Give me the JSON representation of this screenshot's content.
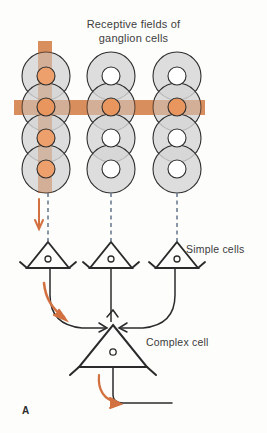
{
  "figure": {
    "panel_letter": "A",
    "title": {
      "line1": "Receptive fields of",
      "line2": "ganglion cells"
    },
    "labels": {
      "simple_cells": "Simple cells",
      "complex_cell": "Complex cell"
    },
    "colors": {
      "stimulus_bar": "#e2986a",
      "stimulus_bar_dark": "#c77a4e",
      "receptive_field_fill": "#d6d6d6",
      "receptive_field_stroke": "#2f2f2f",
      "center_orange": "#eda06c",
      "center_white": "#ffffff",
      "arrow_orange": "#d2713f",
      "neuron_stroke": "#2b2b2b",
      "dashed_line": "#6b7d92",
      "background": "#fdfdfc"
    },
    "stimulus": {
      "vertical_bar": {
        "x": 38,
        "y": 41,
        "width": 14,
        "height": 152
      },
      "horizontal_bar": {
        "x": 14,
        "y": 100,
        "width": 191,
        "height": 15
      }
    },
    "receptive_field_columns": [
      {
        "name": "column-1",
        "cx": 46,
        "centers_y": [
          76,
          107,
          138,
          169
        ],
        "outer_radius": 24,
        "inner_radius": 9,
        "center_fills": [
          "orange",
          "orange",
          "orange",
          "orange"
        ]
      },
      {
        "name": "column-2",
        "cx": 111,
        "centers_y": [
          76,
          107,
          138,
          169
        ],
        "outer_radius": 24,
        "inner_radius": 9,
        "center_fills": [
          "white",
          "orange",
          "white",
          "white"
        ]
      },
      {
        "name": "column-3",
        "cx": 177,
        "centers_y": [
          76,
          107,
          138,
          169
        ],
        "outer_radius": 24,
        "inner_radius": 9,
        "center_fills": [
          "white",
          "orange",
          "white",
          "white"
        ]
      }
    ],
    "dashed_projections": [
      {
        "x": 48,
        "y1": 193,
        "y2": 240
      },
      {
        "x": 111,
        "y1": 193,
        "y2": 240
      },
      {
        "x": 177,
        "y1": 193,
        "y2": 240
      }
    ],
    "simple_cells": [
      {
        "name": "simple-cell-left",
        "cx": 48,
        "apex_y": 242,
        "base_y": 268,
        "half_width": 21
      },
      {
        "name": "simple-cell-middle",
        "cx": 111,
        "apex_y": 242,
        "base_y": 268,
        "half_width": 21
      },
      {
        "name": "simple-cell-right",
        "cx": 177,
        "apex_y": 242,
        "base_y": 268,
        "half_width": 21
      }
    ],
    "complex_cell": {
      "name": "complex-cell",
      "cx": 113,
      "apex_y": 325,
      "base_y": 367,
      "half_width": 34
    },
    "orange_arrows": [
      {
        "name": "input-arrow-vertical",
        "type": "straight-down",
        "x": 39,
        "y1": 200,
        "y2": 228
      },
      {
        "name": "lateral-flow-arrow",
        "type": "curve-left-down",
        "start": [
          52,
          288
        ],
        "end": [
          66,
          320
        ]
      },
      {
        "name": "output-arrow",
        "type": "curve-down-right",
        "start": [
          105,
          378
        ],
        "end": [
          128,
          408
        ]
      }
    ]
  }
}
